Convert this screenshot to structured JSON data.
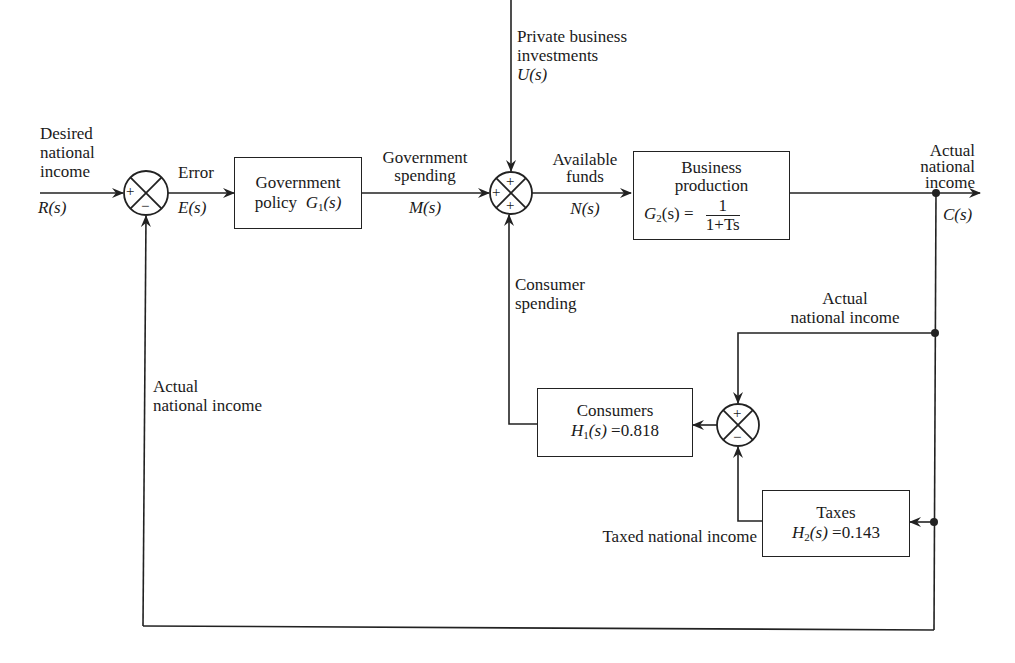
{
  "diagram": {
    "type": "control-system-block-diagram",
    "inputs": {
      "desired": {
        "lines": [
          "Desired",
          "national",
          "income"
        ],
        "symbol": "R(s)"
      },
      "private": {
        "lines": [
          "Private business",
          "investments"
        ],
        "symbol": "U(s)"
      }
    },
    "signals": {
      "error": {
        "label": "Error",
        "symbol": "E(s)"
      },
      "gov_spending": {
        "lines": [
          "Government",
          "spending"
        ],
        "symbol": "M(s)"
      },
      "available": {
        "lines": [
          "Available",
          "funds"
        ],
        "symbol": "N(s)"
      },
      "output": {
        "lines": [
          "Actual",
          "national",
          "income"
        ],
        "symbol": "C(s)"
      },
      "consumer_spending": {
        "lines": [
          "Consumer",
          "spending"
        ]
      },
      "actual_inner": {
        "lines": [
          "Actual",
          "national income"
        ]
      },
      "actual_outer": {
        "lines": [
          "Actual",
          "national income"
        ]
      },
      "taxed": {
        "label": "Taxed national income"
      }
    },
    "blocks": {
      "gov_policy": {
        "line1": "Government",
        "line2_text": "policy",
        "line2_sym": "G",
        "line2_sub": "1",
        "line2_arg": "(s)"
      },
      "business": {
        "line1": "Business",
        "line2": "production",
        "sym": "G",
        "sub": "2",
        "arg": "(s) =",
        "num": "1",
        "den": "1+Ts"
      },
      "consumers": {
        "line1": "Consumers",
        "sym": "H",
        "sub": "1",
        "arg": "(s)",
        "value": "=0.818"
      },
      "taxes": {
        "line1": "Taxes",
        "sym": "H",
        "sub": "2",
        "arg": "(s)",
        "value": "=0.143"
      }
    },
    "junctions": {
      "sum1": {
        "signs": {
          "left": "+",
          "bottom": "−"
        }
      },
      "sum2": {
        "signs": {
          "top": "+",
          "left": "+",
          "bottom": "+"
        }
      },
      "sum3": {
        "signs": {
          "top": "+",
          "bottom": "−"
        }
      }
    },
    "colors": {
      "line": "#222222",
      "text": "#1a1a1a",
      "background": "#ffffff"
    }
  }
}
